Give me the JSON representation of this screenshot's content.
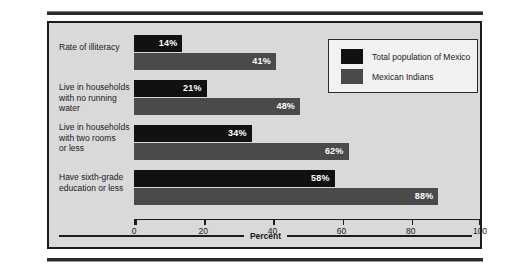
{
  "chart_data": {
    "type": "bar",
    "orientation": "horizontal",
    "title": "",
    "xlabel": "Percent",
    "ylabel": "",
    "xlim": [
      0,
      100
    ],
    "xticks": [
      0,
      20,
      40,
      60,
      80,
      100
    ],
    "xtick_labels": [
      "0",
      "20",
      "40",
      "60",
      "80",
      "100"
    ],
    "grid": false,
    "legend_position": "top-right",
    "categories": [
      "Rate of illiteracy",
      "Live in households\nwith no running water",
      "Live in households\nwith two rooms\nor less",
      "Have sixth-grade\neducation or less"
    ],
    "series": [
      {
        "name": "Total population of Mexico",
        "color": "#111111",
        "values": [
          14,
          21,
          34,
          58
        ],
        "value_labels": [
          "14%",
          "21%",
          "34%",
          "58%"
        ]
      },
      {
        "name": "Mexican Indians",
        "color": "#4a4a4a",
        "values": [
          41,
          48,
          62,
          88
        ],
        "value_labels": [
          "41%",
          "48%",
          "62%",
          "88%"
        ]
      }
    ]
  },
  "legend": {
    "items": [
      {
        "label": "Total population of Mexico",
        "color": "#111111"
      },
      {
        "label": "Mexican Indians",
        "color": "#4a4a4a"
      }
    ]
  },
  "axis": {
    "title": "Percent",
    "tick_labels": [
      "0",
      "20",
      "40",
      "60",
      "80",
      "100"
    ]
  },
  "categories": [
    {
      "lines": [
        "Rate of illiteracy"
      ]
    },
    {
      "lines": [
        "Live in households",
        "with no running water"
      ]
    },
    {
      "lines": [
        "Live in households",
        "with two rooms",
        "or less"
      ]
    },
    {
      "lines": [
        "Have sixth-grade",
        "education or less"
      ]
    }
  ],
  "colors": {
    "panel_background": "#d9d9d9",
    "panel_border": "#1c1c1c",
    "series_total": "#111111",
    "series_indian": "#4a4a4a",
    "value_label_text": "#ffffff"
  }
}
